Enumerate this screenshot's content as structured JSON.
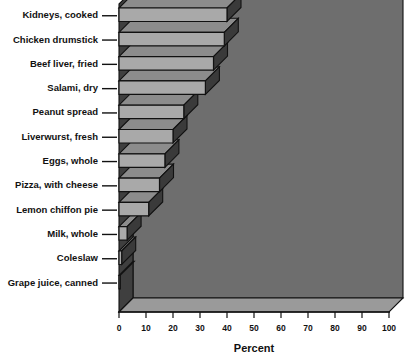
{
  "chart_data": {
    "type": "bar",
    "orientation": "horizontal",
    "style": "3d-perspective",
    "title": "",
    "xlabel": "Percent",
    "ylabel": "",
    "xlim": [
      0,
      100
    ],
    "xticks": [
      0,
      10,
      20,
      30,
      40,
      50,
      60,
      70,
      80,
      90,
      100
    ],
    "xtick_labels": [
      "0",
      "10",
      "20",
      "30",
      "40",
      "50",
      "60",
      "70",
      "80",
      "90",
      "100"
    ],
    "grid": false,
    "legend": null,
    "categories": [
      "Kidneys, cooked",
      "Chicken drumstick",
      "Beef liver, fried",
      "Salami, dry",
      "Peanut spread",
      "Liverwurst, fresh",
      "Eggs, whole",
      "Pizza, with cheese",
      "Lemon chiffon pie",
      "Milk, whole",
      "Coleslaw",
      "Grape juice, canned"
    ],
    "values": [
      40,
      39,
      35,
      32,
      24,
      20,
      17,
      15,
      11,
      3,
      1,
      0.5
    ],
    "series": [
      {
        "name": "Percent",
        "values": [
          40,
          39,
          35,
          32,
          24,
          20,
          17,
          15,
          11,
          3,
          1,
          0.5
        ]
      }
    ]
  },
  "colors": {
    "bar_front": "#a9a9a9",
    "bar_top": "#8c8c8c",
    "bar_side": "#3a3a3a",
    "bar_outline": "#111111",
    "wall": "#6e6e6e",
    "floor": "#9a9a9a",
    "left_wall": "#3f3f3f",
    "axis": "#111111",
    "background": "#ffffff",
    "text": "#111111"
  },
  "geometry": {
    "x_zero_px": 119,
    "x_hundred_px": 389,
    "row_count": 12,
    "row_top_px": 8,
    "row_pitch_px": 24.3,
    "depth_dx_px": 14,
    "depth_dy_px": -14
  }
}
